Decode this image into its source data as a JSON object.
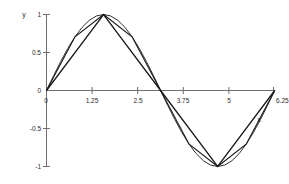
{
  "chart_data": {
    "type": "line",
    "title": "",
    "subtitle": "",
    "xlabel": "x",
    "ylabel": "y",
    "xlim": [
      0,
      6.25
    ],
    "ylim": [
      -1,
      1
    ],
    "grid": false,
    "legend": null,
    "xticks": [
      0,
      1.25,
      2.5,
      3.75,
      5,
      6.25
    ],
    "xtick_labels": [
      "0",
      "1.25",
      "2.5",
      "3.75",
      "5",
      "6.25"
    ],
    "yticks": [
      -1,
      -0.5,
      0,
      0.5,
      1
    ],
    "ytick_labels": [
      "-1",
      "-0.5",
      "0",
      "0.5",
      "1"
    ],
    "series": [
      {
        "name": "sin(x)",
        "kind": "smooth-curve",
        "color": "#1a1a1a",
        "x": [
          0,
          0.1963,
          0.3927,
          0.589,
          0.7854,
          0.9817,
          1.1781,
          1.3744,
          1.5708,
          1.7671,
          1.9635,
          2.1598,
          2.3562,
          2.5525,
          2.7489,
          2.9452,
          3.1416,
          3.3379,
          3.5343,
          3.7306,
          3.927,
          4.1233,
          4.3197,
          4.516,
          4.7124,
          4.9087,
          5.1051,
          5.3014,
          5.4978,
          5.6941,
          5.8905,
          6.0868,
          6.2832
        ],
        "y": [
          0,
          0.1951,
          0.3827,
          0.5556,
          0.7071,
          0.8315,
          0.9239,
          0.9808,
          1,
          0.9808,
          0.9239,
          0.8315,
          0.7071,
          0.5556,
          0.3827,
          0.1951,
          0,
          -0.1951,
          -0.3827,
          -0.5556,
          -0.7071,
          -0.8315,
          -0.9239,
          -0.9808,
          -1,
          -0.9808,
          -0.9239,
          -0.8315,
          -0.7071,
          -0.5556,
          -0.3827,
          -0.1951,
          0
        ]
      },
      {
        "name": "piecewise-linear 4 segments",
        "kind": "polyline",
        "color": "#1a1a1a",
        "x": [
          0,
          1.5708,
          3.1416,
          4.7124,
          6.2832
        ],
        "y": [
          0,
          1,
          0,
          -1,
          0
        ]
      },
      {
        "name": "piecewise-linear 8 segments",
        "kind": "polyline",
        "color": "#1a1a1a",
        "x": [
          0,
          0.7854,
          1.5708,
          2.3562,
          3.1416,
          3.927,
          4.7124,
          5.4978,
          6.2832
        ],
        "y": [
          0,
          0.7071,
          1,
          0.7071,
          0,
          -0.7071,
          -1,
          -0.7071,
          0
        ]
      }
    ]
  },
  "axes": {
    "y_axis_title": "y",
    "x_axis_title": "x"
  }
}
